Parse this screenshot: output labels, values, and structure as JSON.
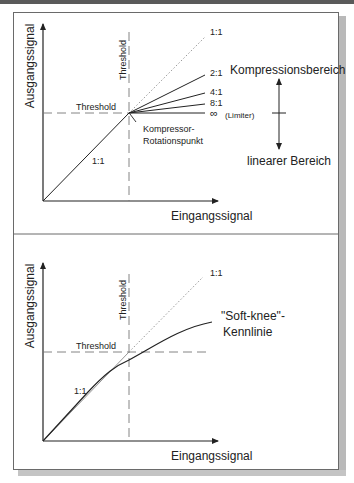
{
  "top_diagram": {
    "y_axis_label": "Ausgangssignal",
    "x_axis_label": "Eingangssignal",
    "threshold_h_label": "Threshold",
    "threshold_v_label": "Threshold",
    "linear_ratio_label": "1:1",
    "ratio_labels": [
      "1:1",
      "2:1",
      "4:1",
      "8:1",
      "∞"
    ],
    "limiter_label": "(Limiter)",
    "rotation_point_label_line1": "Kompressor-",
    "rotation_point_label_line2": "Rotationspunkt",
    "compression_region_label": "Kompressionsbereich",
    "linear_region_label": "linearer Bereich"
  },
  "bottom_diagram": {
    "y_axis_label": "Ausgangssignal",
    "x_axis_label": "Eingangssignal",
    "threshold_h_label": "Threshold",
    "threshold_v_label": "Threshold",
    "linear_ratio_label": "1:1",
    "diagonal_label": "1:1",
    "softknee_label_line1": "\"Soft-knee\"-",
    "softknee_label_line2": "Kennlinie"
  },
  "colors": {
    "line": "#222222",
    "dashed": "#777777",
    "dotted": "#999999",
    "frame": "#6a6a6a",
    "shadow": "#b9b9b9"
  }
}
